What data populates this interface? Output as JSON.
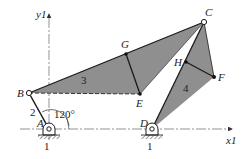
{
  "diagram": {
    "colors": {
      "link_fill": "#8f8f8f",
      "line": "#1a1a1a",
      "axis": "#333333",
      "ground_hatch": "#555555",
      "background": "#ffffff"
    },
    "axes": {
      "x_label": "x1",
      "y_label": "y1"
    },
    "joints": {
      "A": {
        "label": "A",
        "x": 49,
        "y": 129,
        "type": "ground-pivot"
      },
      "B": {
        "label": "B",
        "x": 29,
        "y": 93,
        "type": "pin-open"
      },
      "C": {
        "label": "C",
        "x": 204,
        "y": 22,
        "type": "pin-open"
      },
      "D": {
        "label": "D",
        "x": 152,
        "y": 129,
        "type": "ground-pivot"
      },
      "E": {
        "label": "E",
        "x": 140,
        "y": 94,
        "type": "point"
      },
      "F": {
        "label": "F",
        "x": 214,
        "y": 77,
        "type": "point"
      },
      "G": {
        "label": "G",
        "x": 126,
        "y": 54,
        "type": "point"
      },
      "H": {
        "label": "H",
        "x": 186,
        "y": 62,
        "type": "point"
      }
    },
    "links": {
      "ground_A": "1",
      "ground_D": "1",
      "crank": "2",
      "coupler": "3",
      "rocker": "4"
    },
    "angle": {
      "label": "120°",
      "value_deg": 120
    }
  }
}
